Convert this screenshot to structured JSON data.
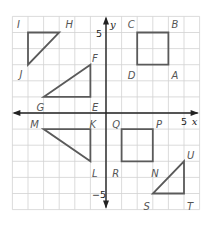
{
  "diagram": {
    "type": "coordinate-plane",
    "x_range": [
      -6,
      6
    ],
    "y_range": [
      -6,
      6
    ],
    "axis_labels": {
      "x": "x",
      "y": "y"
    },
    "tick_labels": [
      {
        "axis": "x",
        "value": 5,
        "text": "5"
      },
      {
        "axis": "y",
        "value": 5,
        "text": "5"
      },
      {
        "axis": "y",
        "value": -5,
        "text": "−5"
      }
    ],
    "colors": {
      "shape_stroke": "#5a5a5a",
      "grid": "#d2d2d2",
      "axis": "#222222",
      "label": "#555555"
    },
    "shapes": [
      {
        "name": "triangle-IHJ",
        "kind": "triangle",
        "vertices": [
          {
            "label": "I",
            "x": -5,
            "y": 5,
            "lx": -0.7,
            "ly": 0.55
          },
          {
            "label": "H",
            "x": -3,
            "y": 5,
            "lx": 0.4,
            "ly": 0.55
          },
          {
            "label": "J",
            "x": -5,
            "y": 3,
            "lx": -0.55,
            "ly": -0.55
          }
        ]
      },
      {
        "name": "triangle-GFE",
        "kind": "triangle",
        "vertices": [
          {
            "label": "G",
            "x": -4,
            "y": 1,
            "lx": -0.45,
            "ly": -0.65
          },
          {
            "label": "F",
            "x": -1,
            "y": 3,
            "lx": 0.1,
            "ly": 0.4
          },
          {
            "label": "E",
            "x": -1,
            "y": 1,
            "lx": 0.1,
            "ly": -0.65
          }
        ]
      },
      {
        "name": "square-ABCD",
        "kind": "quadrilateral",
        "vertices": [
          {
            "label": "C",
            "x": 2,
            "y": 5,
            "lx": -0.6,
            "ly": 0.55
          },
          {
            "label": "B",
            "x": 4,
            "y": 5,
            "lx": 0.2,
            "ly": 0.55
          },
          {
            "label": "A",
            "x": 4,
            "y": 3,
            "lx": 0.2,
            "ly": -0.65
          },
          {
            "label": "D",
            "x": 2,
            "y": 3,
            "lx": -0.6,
            "ly": -0.65
          }
        ]
      },
      {
        "name": "triangle-MKL",
        "kind": "triangle",
        "vertices": [
          {
            "label": "M",
            "x": -4,
            "y": -1,
            "lx": -0.85,
            "ly": 0.3
          },
          {
            "label": "K",
            "x": -1,
            "y": -1,
            "lx": -0.05,
            "ly": 0.3
          },
          {
            "label": "L",
            "x": -1,
            "y": -3,
            "lx": 0.1,
            "ly": -0.75
          }
        ]
      },
      {
        "name": "square-QPNR",
        "kind": "quadrilateral",
        "vertices": [
          {
            "label": "Q",
            "x": 1,
            "y": -1,
            "lx": -0.6,
            "ly": 0.3
          },
          {
            "label": "P",
            "x": 3,
            "y": -1,
            "lx": 0.2,
            "ly": 0.3
          },
          {
            "label": "N",
            "x": 3,
            "y": -3,
            "lx": -0.1,
            "ly": -0.75
          },
          {
            "label": "R",
            "x": 1,
            "y": -3,
            "lx": -0.6,
            "ly": -0.75
          }
        ]
      },
      {
        "name": "triangle-STU",
        "kind": "triangle",
        "vertices": [
          {
            "label": "S",
            "x": 3,
            "y": -5,
            "lx": -0.6,
            "ly": -0.75
          },
          {
            "label": "T",
            "x": 5,
            "y": -5,
            "lx": 0.2,
            "ly": -0.75
          },
          {
            "label": "U",
            "x": 5,
            "y": -3,
            "lx": 0.2,
            "ly": 0.4
          }
        ]
      }
    ]
  }
}
